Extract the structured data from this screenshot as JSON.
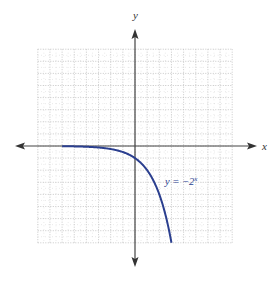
{
  "chart_data": {
    "type": "line",
    "title": "",
    "xlabel": "x",
    "ylabel": "y",
    "xlim": [
      -8,
      8
    ],
    "ylim": [
      -8,
      8
    ],
    "grid": true,
    "grid_style": "dotted",
    "tick_labels_shown": false,
    "series": [
      {
        "name": "y = -2^x",
        "label": "y = −2",
        "label_exponent": "x",
        "color": "#2b3f8f",
        "function": "-2^x",
        "x": [
          -6,
          -5,
          -4,
          -3,
          -2,
          -1,
          0,
          0.5,
          1,
          1.5,
          2,
          2.5,
          3
        ],
        "values": [
          -0.016,
          -0.031,
          -0.063,
          -0.125,
          -0.25,
          -0.5,
          -1,
          -1.414,
          -2,
          -2.828,
          -4,
          -5.657,
          -8
        ]
      }
    ],
    "annotations": [
      {
        "text": "y = −2^x",
        "x": 2.5,
        "y": -3
      }
    ]
  },
  "colors": {
    "axis": "#444444",
    "grid": "#bbbbbb",
    "curve": "#2b3f8f"
  }
}
